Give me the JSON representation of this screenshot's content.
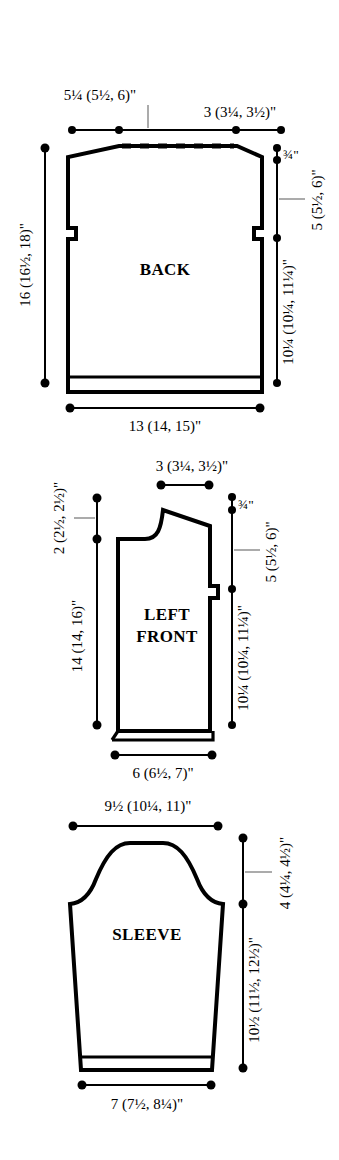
{
  "document": {
    "type": "knitting-pattern-schematic",
    "unit": "inches",
    "size_format": "small (medium, large)"
  },
  "pieces": [
    {
      "id": "back",
      "name": "BACK",
      "measurements": {
        "shoulder_width": "5¼ (5½, 6)\"",
        "neck_width": "3 (3¼, 3½)\"",
        "total_length": "16 (16½, 18)\"",
        "neck_depth": "¾\"",
        "armhole_depth": "5 (5½, 6)\"",
        "body_length": "10¼ (10¼, 11¼)\"",
        "bottom_width": "13 (14, 15)\""
      }
    },
    {
      "id": "left-front",
      "name": "LEFT FRONT",
      "name_line1": "LEFT",
      "name_line2": "FRONT",
      "measurements": {
        "shoulder_width": "3 (3¼, 3½)\"",
        "neck_width": "2 (2½, 2½)\"",
        "total_length": "14 (14, 16)\"",
        "neck_depth": "¾\"",
        "armhole_depth": "5 (5½, 6)\"",
        "body_length": "10¼ (10¼, 11¼)\"",
        "bottom_width": "6 (6½, 7)\""
      }
    },
    {
      "id": "sleeve",
      "name": "SLEEVE",
      "measurements": {
        "upper_width": "9½ (10¼, 11)\"",
        "cap_height": "4 (4¼, 4½)\"",
        "sleeve_length": "10½ (11½, 12½)\"",
        "cuff_width": "7 (7½, 8¼)\""
      }
    }
  ]
}
